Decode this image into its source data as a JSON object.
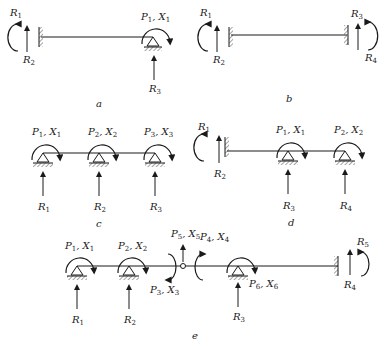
{
  "figures": {
    "a": {
      "caption": "a",
      "labels": {
        "R1": "R",
        "R1s": "1",
        "R2": "R",
        "R2s": "2",
        "R3": "R",
        "R3s": "3",
        "P1": "P",
        "P1s": "1",
        "X1": "X",
        "X1s": "1"
      }
    },
    "b": {
      "caption": "b",
      "labels": {
        "R1": "R",
        "R1s": "1",
        "R2": "R",
        "R2s": "2",
        "R3": "R",
        "R3s": "3",
        "R4": "R",
        "R4s": "4"
      }
    },
    "c": {
      "caption": "c",
      "labels": {
        "P1": "P",
        "P1s": "1",
        "X1": "X",
        "X1s": "1",
        "P2": "P",
        "P2s": "2",
        "X2": "X",
        "X2s": "2",
        "P3": "P",
        "P3s": "3",
        "X3": "X",
        "X3s": "3",
        "R1": "R",
        "R1s": "1",
        "R2": "R",
        "R2s": "2",
        "R3": "R",
        "R3s": "3"
      }
    },
    "d": {
      "caption": "d",
      "labels": {
        "R1": "R",
        "R1s": "1",
        "R2": "R",
        "R2s": "2",
        "P1": "P",
        "P1s": "1",
        "X1": "X",
        "X1s": "1",
        "P2": "P",
        "P2s": "2",
        "X2": "X",
        "X2s": "2",
        "R3": "R",
        "R3s": "3",
        "R4": "R",
        "R4s": "4"
      }
    },
    "e": {
      "caption": "e",
      "labels": {
        "P1": "P",
        "P1s": "1",
        "X1": "X",
        "X1s": "1",
        "P2": "P",
        "P2s": "2",
        "X2": "X",
        "X2s": "2",
        "P3": "P",
        "P3s": "3",
        "X3": "X",
        "X3s": "3",
        "P4": "P",
        "P4s": "4",
        "X4": "X",
        "X4s": "4",
        "P5": "P",
        "P5s": "5",
        "X5": "X",
        "X5s": "5",
        "P6": "P",
        "P6s": "6",
        "X6": "X",
        "X6s": "6",
        "R1": "R",
        "R1s": "1",
        "R2": "R",
        "R2s": "2",
        "R3": "R",
        "R3s": "3",
        "R4": "R",
        "R4s": "4",
        "R5": "R",
        "R5s": "5"
      }
    }
  },
  "colors": {
    "ink": "#1a1a1a",
    "background": "#ffffff"
  }
}
